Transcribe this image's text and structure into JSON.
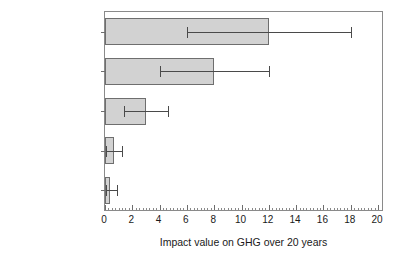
{
  "chart_data": {
    "type": "bar",
    "orientation": "horizontal",
    "title": "",
    "xlabel": "Impact value on GHG over 20 years",
    "ylabel": "",
    "xlim": [
      0,
      20
    ],
    "xticks": [
      0,
      2,
      4,
      6,
      8,
      10,
      12,
      14,
      16,
      18,
      20
    ],
    "xtick_labels": [
      "0",
      "2",
      "4",
      "6",
      "8",
      "10",
      "12",
      "14",
      "16",
      "18",
      "20"
    ],
    "minor_tick_interval": 0.25,
    "grid": false,
    "legend": null,
    "bar_color": "#d2d2d2",
    "bar_edge_color": "#6e6e6e",
    "error_bar_color": "#4a4a4a",
    "categories": [
      "CO2 to fuels",
      "CO2 to olefins",
      "CO2 polymers",
      "CO2 mineralization",
      "CCS"
    ],
    "category_labels_html": [
      "CO<sub>2</sub> to fuels",
      "CO<sub>2</sub> to olefins",
      "CO<sub>2</sub> polymers",
      "CO<sub>2</sub> mineralization",
      "CCS"
    ],
    "values": [
      12.0,
      8.0,
      3.0,
      0.65,
      0.35
    ],
    "error_low": [
      6.0,
      4.0,
      1.4,
      0.05,
      0.05
    ],
    "error_high": [
      18.0,
      12.0,
      4.6,
      1.25,
      0.9
    ]
  }
}
